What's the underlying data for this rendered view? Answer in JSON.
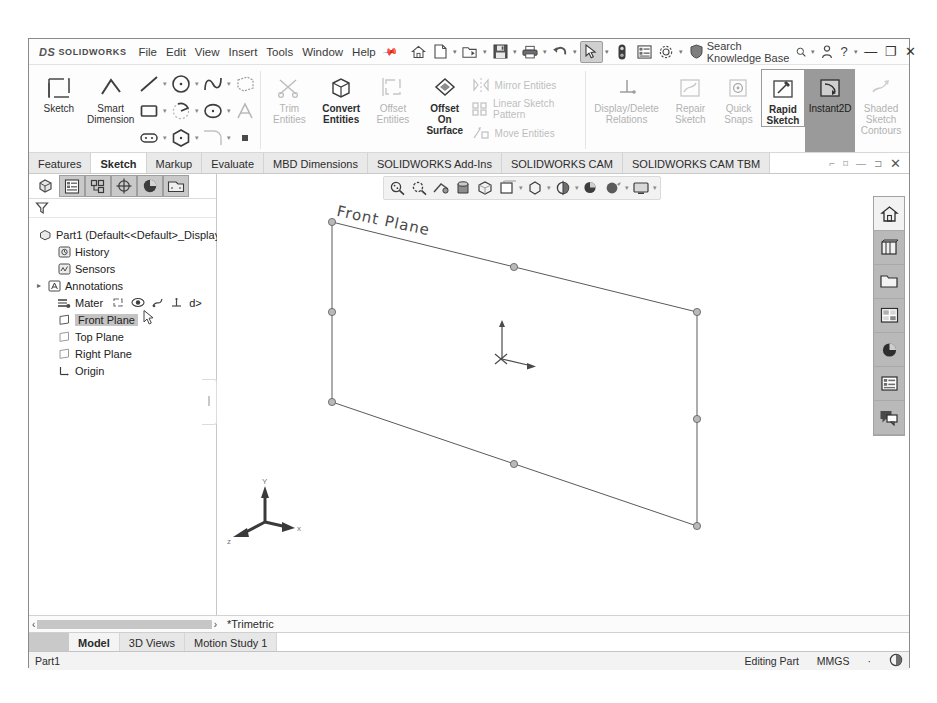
{
  "titlebar": {
    "brand_prefix": "DS",
    "brand": "SOLIDWORKS",
    "menus": [
      "File",
      "Edit",
      "View",
      "Insert",
      "Tools",
      "Window",
      "Help"
    ],
    "pin_icon": "pin-icon",
    "quick_access": [
      {
        "name": "home-icon",
        "label": "Home"
      },
      {
        "name": "new-document-icon",
        "label": "New"
      },
      {
        "name": "open-folder-icon",
        "label": "Open"
      },
      {
        "name": "save-icon",
        "label": "Save"
      },
      {
        "name": "print-icon",
        "label": "Print"
      },
      {
        "name": "undo-icon",
        "label": "Undo"
      },
      {
        "name": "select-arrow-icon",
        "label": "Select"
      },
      {
        "name": "rebuild-icon",
        "label": "Rebuild"
      },
      {
        "name": "options-list-icon",
        "label": "File Properties"
      },
      {
        "name": "gear-icon",
        "label": "Options"
      },
      {
        "name": "shield-icon",
        "label": "Admin"
      }
    ],
    "search_placeholder": "Search Knowledge Base",
    "search_icon": "magnifier-icon",
    "account_icon": "user-icon",
    "help_label": "?",
    "minimize_label": "—",
    "restore_label": "❐",
    "close_label": "✕"
  },
  "ribbon": {
    "sketch_button": {
      "label": "Sketch",
      "icon": "sketch-icon"
    },
    "smart_dimension": {
      "label_line1": "Smart",
      "label_line2": "Dimension",
      "icon": "smart-dimension-icon"
    },
    "entity_tools_row1": [
      "line-icon",
      "circle-icon",
      "spline-icon",
      "3d-sketch-icon"
    ],
    "entity_tools_row2": [
      "rectangle-icon",
      "arc-icon",
      "ellipse-icon",
      "text-icon"
    ],
    "entity_tools_row3": [
      "slot-icon",
      "polygon-icon",
      "fillet-icon",
      "point-icon"
    ],
    "convert_group": [
      {
        "label_line1": "Trim",
        "label_line2": "Entities",
        "icon": "trim-entities-icon",
        "dim": true
      },
      {
        "label_line1": "Convert",
        "label_line2": "Entities",
        "icon": "convert-entities-icon",
        "dim": false
      },
      {
        "label_line1": "Offset",
        "label_line2": "Entities",
        "icon": "offset-entities-icon",
        "dim": true
      },
      {
        "label_line1": "Offset",
        "label_line2": "On",
        "label_line3": "Surface",
        "icon": "offset-on-surface-icon",
        "dim": false
      }
    ],
    "pattern_group": [
      {
        "label": "Mirror Entities",
        "icon": "mirror-entities-icon"
      },
      {
        "label": "Linear Sketch Pattern",
        "icon": "linear-sketch-pattern-icon"
      },
      {
        "label": "Move Entities",
        "icon": "move-entities-icon"
      }
    ],
    "relations_group": [
      {
        "label_line1": "Display/Delete",
        "label_line2": "Relations",
        "icon": "display-delete-relations-icon",
        "dim": true
      },
      {
        "label_line1": "Repair",
        "label_line2": "Sketch",
        "icon": "repair-sketch-icon",
        "dim": true
      },
      {
        "label_line1": "Quick",
        "label_line2": "Snaps",
        "icon": "quick-snaps-icon",
        "dim": true
      },
      {
        "label_line1": "Rapid",
        "label_line2": "Sketch",
        "icon": "rapid-sketch-icon",
        "dim": false,
        "boxed": true
      },
      {
        "label_line1": "Instant2D",
        "icon": "instant2d-icon",
        "dim": false,
        "active": true
      },
      {
        "label_line1": "Shaded",
        "label_line2": "Sketch",
        "label_line3": "Contours",
        "icon": "shaded-sketch-contours-icon",
        "dim": true
      }
    ]
  },
  "command_tabs": {
    "tabs": [
      {
        "label": "Features",
        "active": false
      },
      {
        "label": "Sketch",
        "active": true
      },
      {
        "label": "Markup",
        "active": false
      },
      {
        "label": "Evaluate",
        "active": false
      },
      {
        "label": "MBD Dimensions",
        "active": false
      },
      {
        "label": "SOLIDWORKS Add-Ins",
        "active": false
      },
      {
        "label": "SOLIDWORKS CAM",
        "active": false
      },
      {
        "label": "SOLIDWORKS CAM TBM",
        "active": false
      }
    ],
    "window_buttons": [
      "⌐",
      "⌑",
      "—",
      "⊐",
      "✕"
    ]
  },
  "feature_manager": {
    "tabs": [
      {
        "name": "feature-manager-tree-tab",
        "active": false,
        "icon": "part-tree-icon"
      },
      {
        "name": "property-manager-tab",
        "active": true,
        "icon": "property-list-icon"
      },
      {
        "name": "configuration-manager-tab",
        "active": true,
        "icon": "configuration-icon"
      },
      {
        "name": "dimxpert-manager-tab",
        "active": true,
        "icon": "dimxpert-icon"
      },
      {
        "name": "display-manager-tab",
        "active": true,
        "icon": "appearance-globe-icon"
      },
      {
        "name": "cam-manager-tab",
        "active": true,
        "icon": "cam-tree-icon"
      }
    ],
    "filter_icon": "filter-funnel-icon",
    "tree": [
      {
        "label": "Part1  (Default<<Default>_Display",
        "icon": "part-icon",
        "indent": 0,
        "twisty": "",
        "selected": false
      },
      {
        "label": "History",
        "icon": "history-icon",
        "indent": 1,
        "twisty": "",
        "selected": false
      },
      {
        "label": "Sensors",
        "icon": "sensors-icon",
        "indent": 1,
        "twisty": "",
        "selected": false
      },
      {
        "label": "Annotations",
        "icon": "annotations-icon",
        "indent": 1,
        "twisty": "▸",
        "selected": false
      },
      {
        "label": "Mater",
        "icon": "material-icon",
        "indent": 1,
        "twisty": "",
        "selected": false,
        "suffix": "d>"
      },
      {
        "label": "Front Plane",
        "icon": "plane-icon",
        "indent": 1,
        "twisty": "",
        "selected": true
      },
      {
        "label": "Top Plane",
        "icon": "plane-icon",
        "indent": 1,
        "twisty": "",
        "selected": false
      },
      {
        "label": "Right Plane",
        "icon": "plane-icon",
        "indent": 1,
        "twisty": "",
        "selected": false
      },
      {
        "label": "Origin",
        "icon": "origin-icon",
        "indent": 1,
        "twisty": "",
        "selected": false
      }
    ],
    "context_toolbar": [
      {
        "name": "sketch-context-icon"
      },
      {
        "name": "view-eye-icon"
      },
      {
        "name": "section-view-icon"
      },
      {
        "name": "normal-to-icon"
      }
    ]
  },
  "view_toolbar": [
    {
      "name": "zoom-to-fit-icon"
    },
    {
      "name": "zoom-to-area-icon"
    },
    {
      "name": "previous-view-icon"
    },
    {
      "name": "section-view-icon"
    },
    {
      "name": "view-orientation-icon"
    },
    {
      "name": "display-style-icon"
    },
    {
      "name": "hide-show-items-icon"
    },
    {
      "name": "edit-appearance-icon"
    },
    {
      "name": "apply-scene-icon"
    },
    {
      "name": "view-settings-icon"
    }
  ],
  "task_pane": [
    {
      "name": "home-tab-icon",
      "active": true
    },
    {
      "name": "design-library-icon",
      "active": false
    },
    {
      "name": "file-explorer-icon",
      "active": false
    },
    {
      "name": "view-palette-icon",
      "active": false
    },
    {
      "name": "appearances-scenes-icon",
      "active": false
    },
    {
      "name": "custom-properties-icon",
      "active": false
    },
    {
      "name": "solidworks-forum-icon",
      "active": false
    }
  ],
  "viewport": {
    "plane_label": "Front Plane",
    "triad": {
      "x_label": "x",
      "y_label": "Y",
      "z_label": "z"
    },
    "origin_marker": "sketch-origin-icon"
  },
  "bottom": {
    "scroll_prev": "‹",
    "scroll_next": "›",
    "view_name": "*Trimetric",
    "doc_tabs": [
      {
        "label": "Model",
        "active": true
      },
      {
        "label": "3D Views",
        "active": false
      },
      {
        "label": "Motion Study 1",
        "active": false
      }
    ]
  },
  "statusbar": {
    "document": "Part1",
    "mode": "Editing Part",
    "units": "MMGS",
    "units_caret": "·",
    "overlay_icon": "overlay-icon"
  }
}
